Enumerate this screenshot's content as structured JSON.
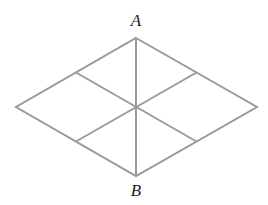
{
  "diagram": {
    "type": "rhombus-subdivided",
    "line_color": "#9a9a9a",
    "line_width": 2,
    "vertices": {
      "top": [
        136,
        38
      ],
      "right": [
        257,
        107
      ],
      "bottom": [
        136,
        176
      ],
      "left": [
        16,
        107
      ]
    },
    "center": [
      136,
      107
    ],
    "edge_midpoints": {
      "upper_left": [
        76,
        72.5
      ],
      "upper_right": [
        196.5,
        72.5
      ],
      "lower_right": [
        196.5,
        141.5
      ],
      "lower_left": [
        76,
        141.5
      ]
    },
    "labels": [
      {
        "id": "A",
        "text": "A",
        "x": 136,
        "y": 12
      },
      {
        "id": "B",
        "text": "B",
        "x": 136,
        "y": 182
      }
    ]
  }
}
